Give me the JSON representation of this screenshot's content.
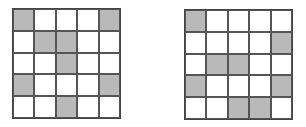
{
  "grids": [
    {
      "name": "left",
      "rows": 5,
      "cols": 5,
      "cells": [
        [
          1,
          0,
          0,
          0,
          1
        ],
        [
          0,
          1,
          1,
          0,
          0
        ],
        [
          0,
          0,
          1,
          0,
          0
        ],
        [
          1,
          0,
          0,
          0,
          1
        ],
        [
          0,
          0,
          1,
          0,
          0
        ]
      ]
    },
    {
      "name": "right",
      "rows": 5,
      "cols": 5,
      "cells": [
        [
          1,
          0,
          0,
          0,
          0
        ],
        [
          0,
          0,
          0,
          0,
          1
        ],
        [
          0,
          1,
          1,
          0,
          0
        ],
        [
          1,
          0,
          0,
          0,
          1
        ],
        [
          0,
          0,
          1,
          1,
          0
        ]
      ]
    }
  ],
  "colors": {
    "filled": "#b9b9b9",
    "empty": "#ffffff",
    "line": "#555555"
  }
}
